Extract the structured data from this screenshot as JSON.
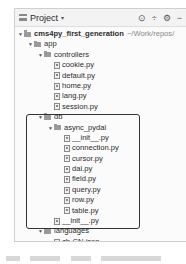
{
  "panel": {
    "title": "Project",
    "title_caret": "▾",
    "tools": [
      "⊙",
      "÷",
      "⚙",
      "−"
    ]
  },
  "tree": {
    "root": {
      "name": "cms4py_first_generation",
      "path": "~/Work/repos/"
    },
    "app": "app",
    "controllers": "controllers",
    "controller_files": [
      "cookie.py",
      "default.py",
      "home.py",
      "lang.py",
      "session.py"
    ],
    "db": "db",
    "async_pydal": "async_pydal",
    "async_pydal_files": [
      "__init__.py",
      "connection.py",
      "cursor.py",
      "dal.py",
      "field.py",
      "query.py",
      "row.py",
      "table.py"
    ],
    "db_init": "__init__.py",
    "languages": "languages",
    "languages_files": [
      "zh-CN.json"
    ]
  },
  "caption": "图 —— 项目 async_pydal 目录结构"
}
